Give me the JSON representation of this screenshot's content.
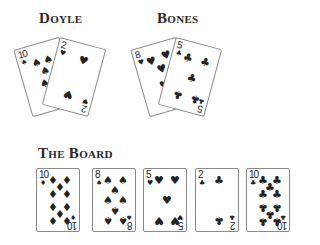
{
  "players": [
    {
      "name": "Doyle",
      "cards": [
        {
          "rank": "10",
          "suit": "♠",
          "suit_name": "spades"
        },
        {
          "rank": "2",
          "suit": "♥",
          "suit_name": "hearts"
        }
      ]
    },
    {
      "name": "Bones",
      "cards": [
        {
          "rank": "8",
          "suit": "♥",
          "suit_name": "hearts"
        },
        {
          "rank": "5",
          "suit": "♣",
          "suit_name": "clubs"
        }
      ]
    }
  ],
  "board": {
    "title": "The Board",
    "cards": [
      {
        "rank": "10",
        "suit": "♦",
        "suit_name": "diamonds"
      },
      {
        "rank": "8",
        "suit": "♠",
        "suit_name": "spades"
      },
      {
        "rank": "5",
        "suit": "♥",
        "suit_name": "hearts"
      },
      {
        "rank": "2",
        "suit": "♣",
        "suit_name": "clubs"
      },
      {
        "rank": "10",
        "suit": "♣",
        "suit_name": "clubs"
      }
    ]
  },
  "colors": {
    "ink": "#222222",
    "card_border": "#8a8a8a",
    "background": "#ffffff"
  }
}
